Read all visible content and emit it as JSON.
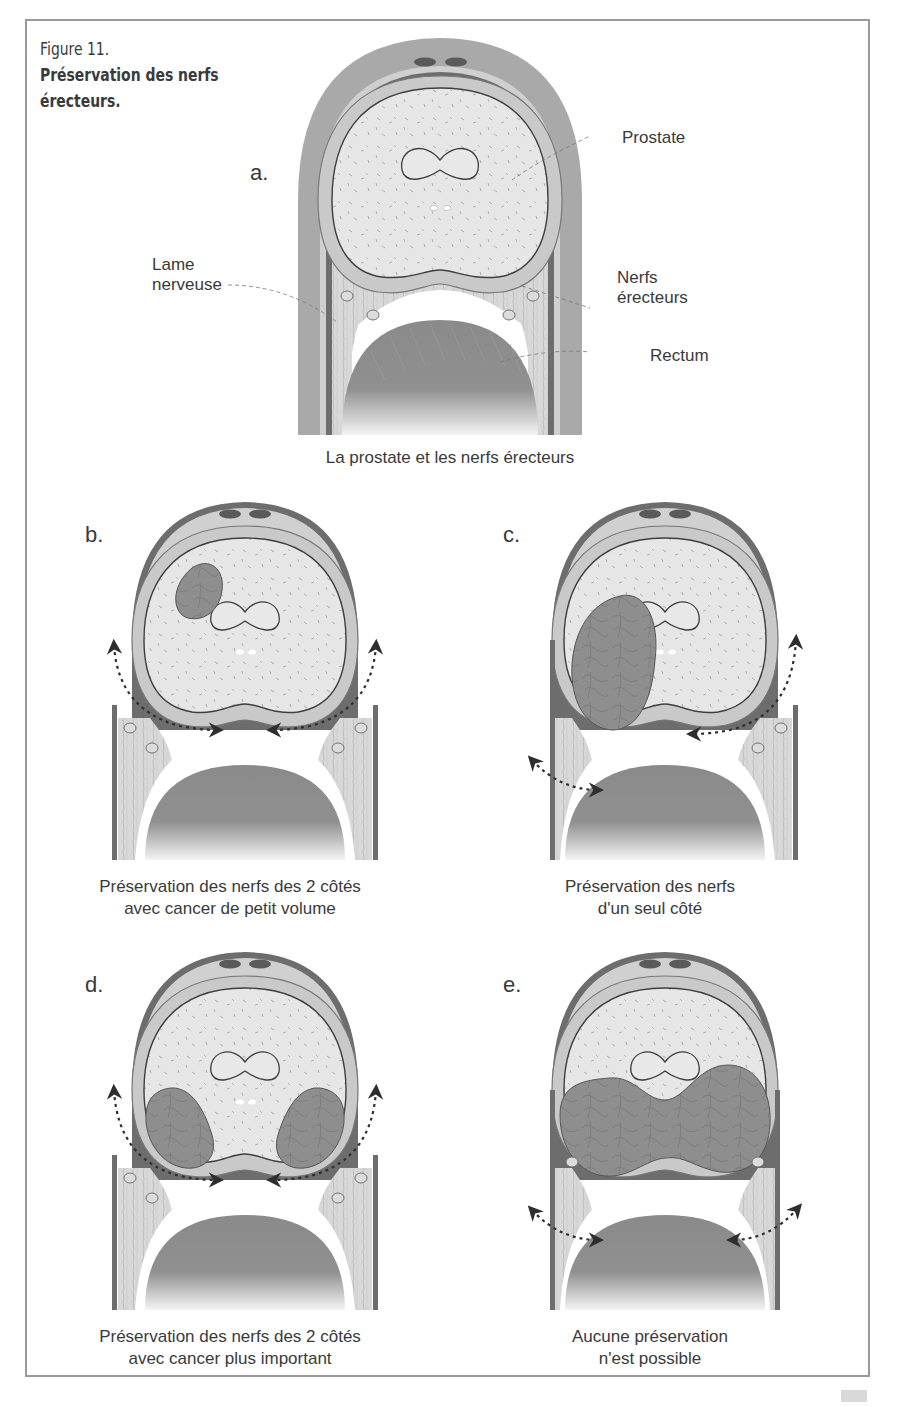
{
  "figure": {
    "number": "Figure 11.",
    "title_line1": "Préservation des nerfs",
    "title_line2": "érecteurs."
  },
  "panels": [
    {
      "letter": "a.",
      "caption_line1": "La prostate et les nerfs érecteurs",
      "caption_line2": "",
      "labels": {
        "prostate": "Prostate",
        "nerfs_line1": "Nerfs",
        "nerfs_line2": "érecteurs",
        "rectum": "Rectum",
        "lame_line1": "Lame",
        "lame_line2": "nerveuse"
      }
    },
    {
      "letter": "b.",
      "caption_line1": "Préservation des nerfs des 2 côtés",
      "caption_line2": "avec cancer de petit volume",
      "tumor": "small-left",
      "nerves_preserved": "both"
    },
    {
      "letter": "c.",
      "caption_line1": "Préservation des nerfs",
      "caption_line2": "d'un seul côté",
      "tumor": "large-left",
      "nerves_preserved": "right"
    },
    {
      "letter": "d.",
      "caption_line1": "Préservation des nerfs des 2 côtés",
      "caption_line2": "avec cancer plus important",
      "tumor": "bilateral",
      "nerves_preserved": "both"
    },
    {
      "letter": "e.",
      "caption_line1": "Aucune préservation",
      "caption_line2": "n'est possible",
      "tumor": "extensive",
      "nerves_preserved": "none"
    }
  ],
  "colors": {
    "frame": "#9a9a9a",
    "prostate_fill": "#e6e6e6",
    "capsule": "#c8c8c8",
    "outer_band": "#a8a8a8",
    "tumor": "#8a8a8a",
    "rectum": "#8c8c8c",
    "text": "#3a3a3a"
  }
}
